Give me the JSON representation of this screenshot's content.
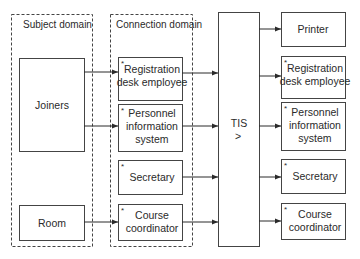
{
  "domains": {
    "subject": {
      "title": "Subject domain",
      "boxes": [
        {
          "id": "joiners",
          "lines": [
            "Joiners"
          ]
        },
        {
          "id": "room",
          "lines": [
            "Room"
          ]
        }
      ]
    },
    "connection": {
      "title": "Connection domain",
      "boxes": [
        {
          "id": "conn-registration",
          "lines": [
            "Registration",
            "desk employee"
          ],
          "marker": "*"
        },
        {
          "id": "conn-personnel",
          "lines": [
            "Personnel",
            "information",
            "system"
          ],
          "marker": "*"
        },
        {
          "id": "conn-secretary",
          "lines": [
            "Secretary"
          ],
          "marker": "*"
        },
        {
          "id": "conn-course",
          "lines": [
            "Course",
            "coordinator"
          ],
          "marker": "*"
        }
      ]
    }
  },
  "system": {
    "label": "TIS",
    "symbol": ">"
  },
  "outputs": [
    {
      "id": "out-printer",
      "lines": [
        "Printer"
      ],
      "marker": ""
    },
    {
      "id": "out-registration",
      "lines": [
        "Registration",
        "desk employee"
      ],
      "marker": "*"
    },
    {
      "id": "out-personnel",
      "lines": [
        "Personnel",
        "information",
        "system"
      ],
      "marker": "*"
    },
    {
      "id": "out-secretary",
      "lines": [
        "Secretary"
      ],
      "marker": "*"
    },
    {
      "id": "out-course",
      "lines": [
        "Course",
        "coordinator"
      ],
      "marker": "*"
    }
  ]
}
